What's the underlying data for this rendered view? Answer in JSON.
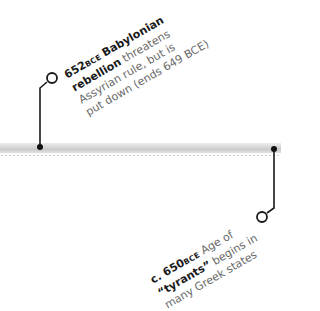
{
  "timeline": {
    "band_color": "#d6d6d6",
    "events": [
      {
        "year": "652",
        "era": "BCE",
        "headline_part1": "Babylonian",
        "headline_part2": "rebellion",
        "text_line1_rest": "threatens",
        "text_line2": "Assyrian rule, but is",
        "text_line3": "put down (ends 649 BCE)",
        "position": "above"
      },
      {
        "year": "c. 650",
        "era": "BCE",
        "text_line1_rest": "Age of",
        "headline_part1": "“tyrants”",
        "text_line2_rest": "begins in",
        "text_line3": "many Greek states",
        "position": "below"
      }
    ]
  }
}
